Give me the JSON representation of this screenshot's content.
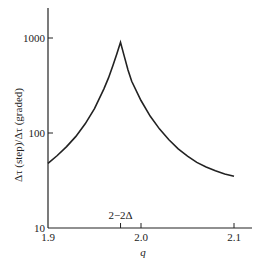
{
  "chart_data": {
    "type": "line",
    "title": "",
    "xlabel": "q",
    "ylabel": "Δτ (step)/Δτ (graded)",
    "yscale": "log",
    "xlim": [
      1.9,
      2.1
    ],
    "ylim": [
      10,
      1000
    ],
    "x_ticks": [
      {
        "value": 1.9,
        "label": "1.9"
      },
      {
        "value": 2.0,
        "label": "2.0"
      },
      {
        "value": 2.1,
        "label": "2.1"
      }
    ],
    "y_ticks": [
      {
        "value": 10,
        "label": "10"
      },
      {
        "value": 100,
        "label": "100"
      },
      {
        "value": 1000,
        "label": "1000"
      }
    ],
    "annotations": [
      {
        "x": 1.978,
        "label": "2−2Δ",
        "type": "x-tick-marker"
      }
    ],
    "grid": false,
    "legend": null,
    "series": [
      {
        "name": "Δτ (step)/Δτ (graded)",
        "x": [
          1.9,
          1.91,
          1.92,
          1.93,
          1.94,
          1.95,
          1.96,
          1.965,
          1.97,
          1.974,
          1.978,
          1.982,
          1.986,
          1.99,
          2.0,
          2.01,
          2.02,
          2.03,
          2.04,
          2.05,
          2.06,
          2.07,
          2.08,
          2.09,
          2.1
        ],
        "values": [
          48,
          58,
          72,
          92,
          125,
          180,
          290,
          380,
          520,
          680,
          900,
          640,
          460,
          350,
          220,
          150,
          110,
          85,
          68,
          57,
          49,
          44,
          40,
          37,
          35
        ]
      }
    ]
  }
}
